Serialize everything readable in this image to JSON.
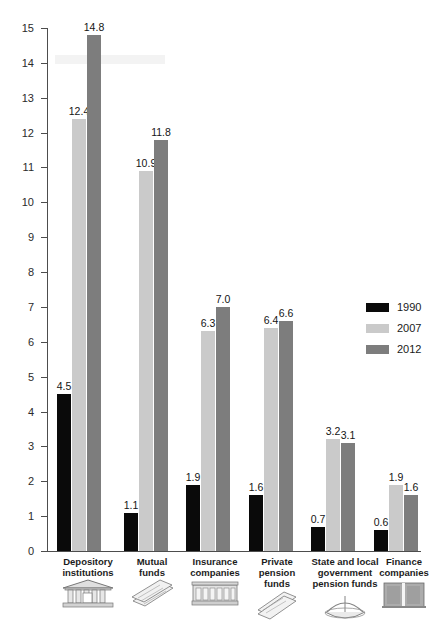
{
  "chart_data": {
    "type": "bar",
    "title": "",
    "subtitle": "",
    "xlabel": "",
    "ylabel": "",
    "ylim": [
      0,
      15
    ],
    "ytick_labels": [
      "0",
      "1",
      "2",
      "3",
      "4",
      "5",
      "6",
      "7",
      "8",
      "9",
      "10",
      "11",
      "12",
      "13",
      "14",
      "15"
    ],
    "grid": false,
    "legend_position": "inside-right",
    "categories": [
      "Depository institutions",
      "Mutual funds",
      "Insurance companies",
      "Private pension funds",
      "State and local government pension funds",
      "Finance companies"
    ],
    "category_lines": [
      [
        "Depository",
        "institutions"
      ],
      [
        "Mutual",
        "funds"
      ],
      [
        "Insurance",
        "companies"
      ],
      [
        "Private",
        "pension",
        "funds"
      ],
      [
        "State and local",
        "government",
        "pension funds"
      ],
      [
        "Finance",
        "companies"
      ]
    ],
    "category_icons": [
      "bank-building-icon",
      "stacked-documents-icon",
      "ledger-book-icon",
      "paper-stack-icon",
      "scales-balance-icon",
      "office-building-icon"
    ],
    "series": [
      {
        "name": "1990",
        "color": "#0a0a0a",
        "values": [
          4.5,
          1.1,
          1.9,
          1.6,
          0.7,
          0.6
        ]
      },
      {
        "name": "2007",
        "color": "#cacaca",
        "values": [
          12.4,
          10.9,
          6.3,
          6.4,
          3.2,
          1.9
        ]
      },
      {
        "name": "2012",
        "color": "#7d7d7d",
        "values": [
          14.8,
          11.8,
          7.0,
          6.6,
          3.1,
          1.6
        ]
      }
    ],
    "value_labels": [
      [
        "4.5",
        "12.4",
        "14.8"
      ],
      [
        "1.1",
        "10.9",
        "11.8"
      ],
      [
        "1.9",
        "6.3",
        "7.0"
      ],
      [
        "1.6",
        "6.4",
        "6.6"
      ],
      [
        "0.7",
        "3.2",
        "3.1"
      ],
      [
        "0.6",
        "1.9",
        "1.6"
      ]
    ]
  },
  "legend": {
    "entries": [
      {
        "label": "1990",
        "color": "#0a0a0a"
      },
      {
        "label": "2007",
        "color": "#cacaca"
      },
      {
        "label": "2012",
        "color": "#7d7d7d"
      }
    ]
  }
}
